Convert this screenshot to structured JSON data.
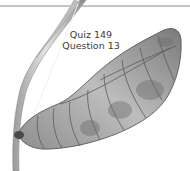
{
  "caption": {
    "line1": "Quiz 149",
    "line2": "Question 13"
  },
  "illustration": {
    "subject": "chrysalis-on-stem",
    "style": "grayscale",
    "colors": {
      "background": "#ffffff",
      "rule": "#8a8a8a",
      "stem_light": "#d8d8d8",
      "stem_dark": "#8c8c8c",
      "pupa_light": "#c9c9c9",
      "pupa_mid": "#9a9a9a",
      "pupa_dark": "#4a4a4a"
    }
  }
}
